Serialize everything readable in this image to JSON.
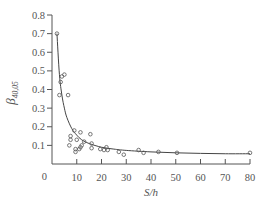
{
  "chart_data": {
    "type": "scatter",
    "title": "",
    "xlabel": "S/h",
    "ylabel": "β_{40,05}",
    "ylabel_main": "β",
    "ylabel_sub": "40,05",
    "xlim": [
      0,
      80
    ],
    "ylim": [
      0,
      0.8
    ],
    "x_ticks": [
      0,
      10,
      20,
      30,
      40,
      50,
      60,
      70,
      80
    ],
    "x_tick_labels": [
      "0",
      "10",
      "20",
      "30",
      "40",
      "50",
      "60",
      "70",
      "80"
    ],
    "y_ticks": [
      0.1,
      0.2,
      0.3,
      0.4,
      0.5,
      0.6,
      0.7,
      0.8
    ],
    "y_tick_labels": [
      "0.1",
      "0.2",
      "0.3",
      "0.4",
      "0.5",
      "0.6",
      "0.7",
      "0.8"
    ],
    "grid": false,
    "legend": null,
    "series": [
      {
        "name": "measured",
        "marker": "open-circle",
        "x": [
          2,
          3.5,
          4,
          5,
          3,
          6.5,
          7,
          7.5,
          7.5,
          9,
          9.5,
          9.5,
          10,
          11,
          11.5,
          11.5,
          12,
          13,
          15.5,
          16,
          16,
          19.5,
          21,
          22,
          22.5,
          27,
          29,
          35,
          37,
          43,
          50.5,
          80
        ],
        "y": [
          0.7,
          0.44,
          0.47,
          0.48,
          0.37,
          0.37,
          0.1,
          0.13,
          0.15,
          0.18,
          0.08,
          0.065,
          0.13,
          0.08,
          0.17,
          0.09,
          0.1,
          0.12,
          0.16,
          0.11,
          0.085,
          0.08,
          0.075,
          0.09,
          0.075,
          0.065,
          0.05,
          0.075,
          0.06,
          0.065,
          0.06,
          0.06
        ]
      },
      {
        "name": "fitted curve",
        "marker": "line",
        "x": [
          2,
          3,
          4,
          5,
          6,
          8,
          10,
          12,
          15,
          20,
          25,
          30,
          40,
          50,
          60,
          70,
          80
        ],
        "y": [
          0.7,
          0.48,
          0.37,
          0.3,
          0.25,
          0.19,
          0.155,
          0.13,
          0.11,
          0.09,
          0.08,
          0.073,
          0.065,
          0.06,
          0.057,
          0.055,
          0.055
        ]
      }
    ]
  }
}
